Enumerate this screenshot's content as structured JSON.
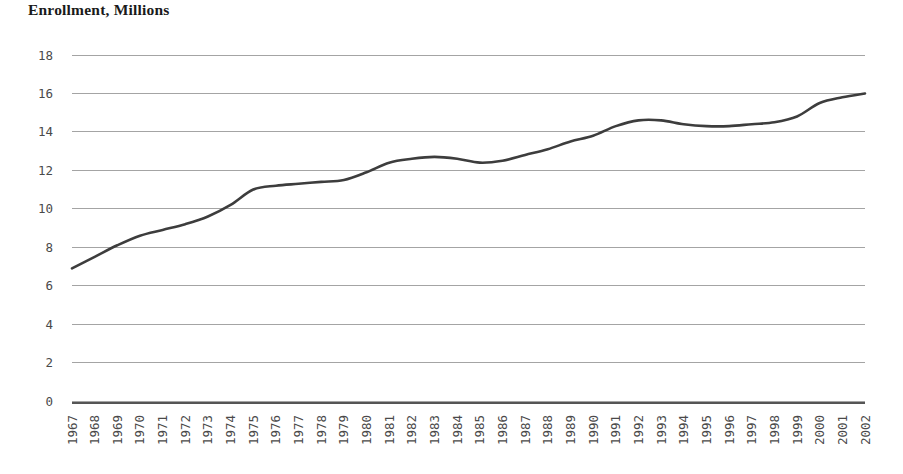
{
  "chart_data": {
    "type": "line",
    "title": "Enrollment, Millions",
    "xlabel": "",
    "ylabel": "",
    "ylim": [
      0,
      18
    ],
    "yticks": [
      0,
      2,
      4,
      6,
      8,
      10,
      12,
      14,
      16,
      18
    ],
    "grid": true,
    "legend": "none",
    "line_color": "#3d3d3d",
    "grid_color": "#9a9a9a",
    "axis_color": "#555555",
    "categories": [
      "1967",
      "1968",
      "1969",
      "1970",
      "1971",
      "1972",
      "1973",
      "1974",
      "1975",
      "1976",
      "1977",
      "1978",
      "1979",
      "1980",
      "1981",
      "1982",
      "1983",
      "1984",
      "1985",
      "1986",
      "1987",
      "1988",
      "1989",
      "1990",
      "1991",
      "1992",
      "1993",
      "1994",
      "1995",
      "1996",
      "1997",
      "1998",
      "1999",
      "2000",
      "2001",
      "2002"
    ],
    "values": [
      6.9,
      7.5,
      8.1,
      8.6,
      8.9,
      9.2,
      9.6,
      10.2,
      11.0,
      11.2,
      11.3,
      11.4,
      11.5,
      11.9,
      12.4,
      12.6,
      12.7,
      12.6,
      12.4,
      12.5,
      12.8,
      13.1,
      13.5,
      13.8,
      14.3,
      14.6,
      14.6,
      14.4,
      14.3,
      14.3,
      14.4,
      14.5,
      14.8,
      15.5,
      15.8,
      16.0
    ]
  },
  "axis": {
    "y_tick_labels": [
      "18",
      "16",
      "14",
      "12",
      "10",
      "8",
      "6",
      "4",
      "2",
      "0"
    ],
    "x_tick_labels": [
      "1967",
      "1968",
      "1969",
      "1970",
      "1971",
      "1972",
      "1973",
      "1974",
      "1975",
      "1976",
      "1977",
      "1978",
      "1979",
      "1980",
      "1981",
      "1982",
      "1983",
      "1984",
      "1985",
      "1986",
      "1987",
      "1988",
      "1989",
      "1990",
      "1991",
      "1992",
      "1993",
      "1994",
      "1995",
      "1996",
      "1997",
      "1998",
      "1999",
      "2000",
      "2001",
      "2002"
    ]
  }
}
